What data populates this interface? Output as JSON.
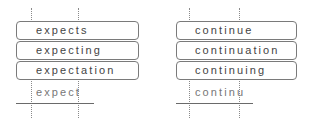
{
  "groups": [
    {
      "id": "expect",
      "words": [
        "expects",
        "expecting",
        "expectation"
      ],
      "stem": "expect"
    },
    {
      "id": "continue",
      "words": [
        "continue",
        "continuation",
        "continuing"
      ],
      "stem": "continu"
    }
  ]
}
